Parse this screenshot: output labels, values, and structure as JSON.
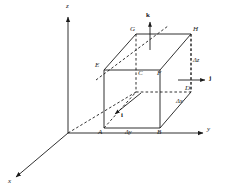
{
  "figure": {
    "type": "3d-coordinate-box-diagram",
    "background_color": "#ffffff",
    "line_color": "#1a1a1a",
    "axes": {
      "x_label": "x",
      "y_label": "y",
      "z_label": "z",
      "origin_label": ""
    },
    "unit_vectors": [
      {
        "name": "i",
        "label": "i"
      },
      {
        "name": "j",
        "label": "j"
      },
      {
        "name": "k",
        "label": "k"
      }
    ],
    "vertices": [
      {
        "name": "A",
        "label": "A"
      },
      {
        "name": "B",
        "label": "B"
      },
      {
        "name": "C",
        "label": "C"
      },
      {
        "name": "D",
        "label": "D"
      },
      {
        "name": "E",
        "label": "E"
      },
      {
        "name": "F",
        "label": "F"
      },
      {
        "name": "G",
        "label": "G"
      },
      {
        "name": "H",
        "label": "H"
      }
    ],
    "dimensions": [
      {
        "name": "delta-x",
        "label": "Δx"
      },
      {
        "name": "delta-y",
        "label": "Δy"
      },
      {
        "name": "delta-z",
        "label": "Δz"
      }
    ]
  }
}
